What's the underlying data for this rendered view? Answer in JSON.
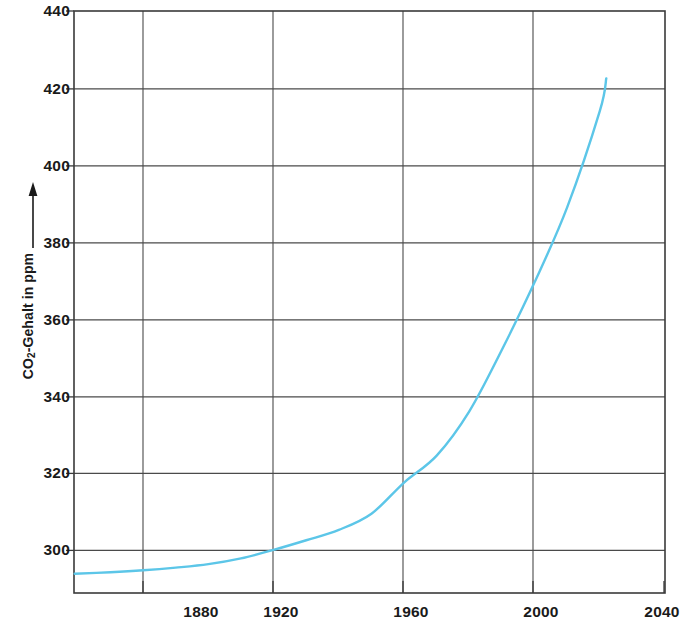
{
  "chart_data": {
    "type": "line",
    "title": "",
    "subtitle": "",
    "xlabel": "",
    "ylabel": "CO2-Gehalt in ppm",
    "ylabel_parts": {
      "prefix": "CO",
      "sub": "2",
      "suffix": "-Gehalt in ppm"
    },
    "y_axis_arrow": true,
    "grid": true,
    "legend": "none",
    "xlim": [
      1858.8,
      2040
    ],
    "ylim": [
      288.8,
      440
    ],
    "x_ticks": [
      1880,
      1920,
      1960,
      2000,
      2040
    ],
    "x_tick_labels": [
      "1880",
      "1920",
      "1960",
      "2000",
      "2040"
    ],
    "y_ticks": [
      300,
      320,
      340,
      360,
      380,
      400,
      420,
      440
    ],
    "y_tick_labels": [
      "300",
      "320",
      "340",
      "360",
      "380",
      "400",
      "420",
      "440"
    ],
    "series": [
      {
        "name": "CO2-Gehalt",
        "color": "#5cc6e8",
        "x": [
          1859,
          1870,
          1880,
          1890,
          1900,
          1910,
          1920,
          1930,
          1940,
          1950,
          1960,
          1970,
          1980,
          1990,
          2000,
          2010,
          2020,
          2022
        ],
        "values": [
          293.8,
          294.2,
          294.7,
          295.4,
          296.3,
          297.8,
          300.0,
          302.5,
          305.2,
          309.4,
          317.5,
          324.5,
          336.0,
          352.0,
          369.5,
          389.0,
          414.0,
          422.5
        ]
      }
    ],
    "annotations": []
  },
  "axis_geometry": {
    "plot_left_px": 74,
    "plot_right_px": 665,
    "plot_top_px": 11,
    "plot_bottom_px": 593
  },
  "colors": {
    "curve": "#5cc6e8",
    "frame": "#3a3a3a",
    "grid": "#4a4a4a",
    "text": "#1a1a1a",
    "background": "#ffffff"
  }
}
